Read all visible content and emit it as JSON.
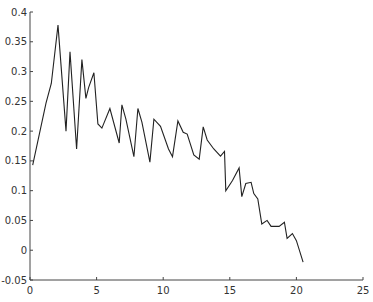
{
  "chart_data": {
    "type": "line",
    "title": "",
    "xlabel": "",
    "ylabel": "",
    "xlim": [
      0,
      25
    ],
    "ylim": [
      -0.05,
      0.4
    ],
    "grid": false,
    "legend": null,
    "x_ticks": [
      0,
      5,
      10,
      15,
      20,
      25
    ],
    "x_tick_labels": [
      "0",
      "5",
      "10",
      "15",
      "20",
      "25"
    ],
    "y_ticks": [
      -0.05,
      0,
      0.05,
      0.1,
      0.15,
      0.2,
      0.25,
      0.3,
      0.35,
      0.4
    ],
    "y_tick_labels": [
      "-0.05",
      "0",
      "0.05",
      "0.1",
      "0.15",
      "0.2",
      "0.25",
      "0.3",
      "0.35",
      "0.4"
    ],
    "series": [
      {
        "name": "series-1",
        "color": "#222222",
        "x": [
          0.2,
          1.2,
          1.6,
          2.1,
          2.7,
          3.0,
          3.5,
          3.9,
          4.2,
          4.4,
          4.8,
          5.1,
          5.4,
          6.0,
          6.7,
          6.9,
          7.2,
          7.8,
          8.1,
          8.4,
          9.0,
          9.3,
          9.8,
          10.4,
          10.7,
          11.1,
          11.5,
          11.8,
          12.3,
          12.7,
          13.0,
          13.3,
          13.8,
          14.3,
          14.6,
          14.7,
          15.2,
          15.7,
          15.9,
          16.2,
          16.6,
          16.8,
          17.1,
          17.4,
          17.8,
          18.1,
          18.7,
          19.1,
          19.3,
          19.7,
          20.0,
          20.5
        ],
        "y": [
          0.143,
          0.247,
          0.28,
          0.378,
          0.2,
          0.333,
          0.17,
          0.32,
          0.255,
          0.273,
          0.298,
          0.212,
          0.205,
          0.238,
          0.18,
          0.244,
          0.22,
          0.157,
          0.238,
          0.215,
          0.148,
          0.22,
          0.208,
          0.17,
          0.157,
          0.217,
          0.198,
          0.195,
          0.16,
          0.153,
          0.207,
          0.185,
          0.17,
          0.158,
          0.166,
          0.1,
          0.117,
          0.138,
          0.09,
          0.112,
          0.114,
          0.095,
          0.086,
          0.044,
          0.05,
          0.04,
          0.04,
          0.047,
          0.02,
          0.028,
          0.016,
          -0.02
        ]
      }
    ]
  }
}
